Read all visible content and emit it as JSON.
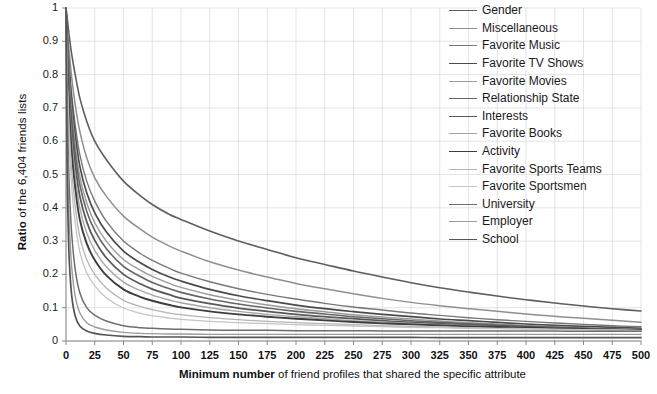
{
  "chart_data": {
    "type": "line",
    "title": "",
    "xlabel_bold": "Minimum number",
    "xlabel_rest": " of friend profiles that shared the specific attribute",
    "ylabel_bold": "Ratio",
    "ylabel_rest": " of the 6,404 friends lists",
    "xlim": [
      0,
      500
    ],
    "ylim": [
      0,
      1
    ],
    "grid": true,
    "legend_position": "top-right",
    "x_ticks": [
      "0",
      "25",
      "50",
      "75",
      "100",
      "125",
      "150",
      "175",
      "200",
      "225",
      "250",
      "275",
      "300",
      "325",
      "350",
      "375",
      "400",
      "425",
      "450",
      "475",
      "500"
    ],
    "y_ticks": [
      "1",
      "0.9",
      "0.8",
      "0.7",
      "0.6",
      "0.5",
      "0.4",
      "0.3",
      "0.2",
      "0.1",
      "0"
    ],
    "x": [
      0,
      1,
      2,
      3,
      5,
      8,
      12,
      18,
      25,
      35,
      50,
      65,
      75,
      90,
      100,
      125,
      150,
      175,
      200,
      225,
      250,
      275,
      300,
      325,
      350,
      375,
      400,
      425,
      450,
      475,
      500
    ],
    "series": [
      {
        "name": "Gender",
        "color": "#5e5e5e",
        "width": 1.6,
        "values": [
          1.0,
          0.97,
          0.94,
          0.91,
          0.86,
          0.8,
          0.73,
          0.66,
          0.6,
          0.545,
          0.48,
          0.435,
          0.41,
          0.38,
          0.365,
          0.33,
          0.3,
          0.275,
          0.25,
          0.23,
          0.21,
          0.192,
          0.175,
          0.16,
          0.147,
          0.135,
          0.124,
          0.114,
          0.105,
          0.097,
          0.09
        ]
      },
      {
        "name": "Miscellaneous",
        "color": "#8f8f8f",
        "width": 1.5,
        "values": [
          1.0,
          0.95,
          0.9,
          0.86,
          0.79,
          0.71,
          0.63,
          0.55,
          0.49,
          0.435,
          0.375,
          0.335,
          0.312,
          0.285,
          0.27,
          0.238,
          0.213,
          0.192,
          0.173,
          0.157,
          0.142,
          0.128,
          0.116,
          0.106,
          0.097,
          0.089,
          0.081,
          0.074,
          0.068,
          0.062,
          0.056
        ]
      },
      {
        "name": "Favorite Music",
        "color": "#787878",
        "width": 1.4,
        "values": [
          1.0,
          0.93,
          0.87,
          0.82,
          0.74,
          0.65,
          0.56,
          0.48,
          0.42,
          0.36,
          0.3,
          0.262,
          0.242,
          0.218,
          0.204,
          0.178,
          0.157,
          0.14,
          0.126,
          0.113,
          0.102,
          0.093,
          0.084,
          0.077,
          0.07,
          0.064,
          0.059,
          0.054,
          0.05,
          0.046,
          0.043
        ]
      },
      {
        "name": "Favorite TV Shows",
        "color": "#4a4a4a",
        "width": 1.7,
        "values": [
          1.0,
          0.92,
          0.855,
          0.8,
          0.715,
          0.62,
          0.525,
          0.445,
          0.385,
          0.328,
          0.27,
          0.234,
          0.215,
          0.192,
          0.18,
          0.155,
          0.136,
          0.121,
          0.108,
          0.097,
          0.088,
          0.08,
          0.073,
          0.066,
          0.061,
          0.056,
          0.051,
          0.047,
          0.044,
          0.041,
          0.038
        ]
      },
      {
        "name": "Favorite Movies",
        "color": "#9a9a9a",
        "width": 1.4,
        "values": [
          1.0,
          0.91,
          0.84,
          0.78,
          0.69,
          0.59,
          0.495,
          0.415,
          0.355,
          0.3,
          0.245,
          0.212,
          0.194,
          0.173,
          0.161,
          0.139,
          0.122,
          0.108,
          0.097,
          0.088,
          0.079,
          0.072,
          0.066,
          0.06,
          0.055,
          0.051,
          0.047,
          0.043,
          0.04,
          0.037,
          0.035
        ]
      },
      {
        "name": "Relationship State",
        "color": "#666666",
        "width": 1.6,
        "values": [
          1.0,
          0.9,
          0.825,
          0.76,
          0.665,
          0.565,
          0.47,
          0.39,
          0.332,
          0.278,
          0.224,
          0.193,
          0.176,
          0.157,
          0.146,
          0.126,
          0.111,
          0.099,
          0.089,
          0.081,
          0.073,
          0.067,
          0.061,
          0.056,
          0.052,
          0.048,
          0.044,
          0.041,
          0.038,
          0.036,
          0.034
        ]
      },
      {
        "name": "Interests",
        "color": "#585858",
        "width": 1.8,
        "values": [
          1.0,
          0.885,
          0.8,
          0.73,
          0.63,
          0.53,
          0.435,
          0.358,
          0.302,
          0.25,
          0.2,
          0.171,
          0.156,
          0.139,
          0.129,
          0.112,
          0.099,
          0.089,
          0.08,
          0.073,
          0.067,
          0.061,
          0.056,
          0.052,
          0.048,
          0.045,
          0.042,
          0.039,
          0.037,
          0.035,
          0.033
        ]
      },
      {
        "name": "Favorite Books",
        "color": "#a5a5a5",
        "width": 1.4,
        "values": [
          1.0,
          0.87,
          0.78,
          0.705,
          0.6,
          0.495,
          0.4,
          0.325,
          0.272,
          0.223,
          0.177,
          0.151,
          0.138,
          0.123,
          0.115,
          0.1,
          0.089,
          0.08,
          0.073,
          0.067,
          0.061,
          0.057,
          0.053,
          0.049,
          0.046,
          0.043,
          0.04,
          0.038,
          0.036,
          0.034,
          0.032
        ]
      },
      {
        "name": "Activity",
        "color": "#3d3d3d",
        "width": 1.9,
        "values": [
          1.0,
          0.85,
          0.755,
          0.675,
          0.565,
          0.46,
          0.365,
          0.293,
          0.243,
          0.197,
          0.155,
          0.132,
          0.121,
          0.108,
          0.101,
          0.089,
          0.08,
          0.073,
          0.067,
          0.062,
          0.057,
          0.053,
          0.05,
          0.047,
          0.044,
          0.042,
          0.04,
          0.038,
          0.036,
          0.034,
          0.032
        ]
      },
      {
        "name": "Favorite Sports Teams",
        "color": "#b4b4b4",
        "width": 1.3,
        "values": [
          1.0,
          0.82,
          0.71,
          0.625,
          0.51,
          0.405,
          0.313,
          0.245,
          0.2,
          0.159,
          0.122,
          0.103,
          0.094,
          0.084,
          0.079,
          0.07,
          0.064,
          0.059,
          0.055,
          0.052,
          0.049,
          0.046,
          0.044,
          0.042,
          0.04,
          0.038,
          0.037,
          0.035,
          0.034,
          0.033,
          0.031
        ]
      },
      {
        "name": "Favorite Sportsmen",
        "color": "#c4c4c4",
        "width": 1.3,
        "values": [
          1.0,
          0.79,
          0.67,
          0.58,
          0.46,
          0.355,
          0.268,
          0.205,
          0.166,
          0.13,
          0.099,
          0.083,
          0.076,
          0.069,
          0.065,
          0.059,
          0.055,
          0.052,
          0.049,
          0.047,
          0.045,
          0.043,
          0.041,
          0.04,
          0.038,
          0.037,
          0.036,
          0.035,
          0.034,
          0.033,
          0.031
        ]
      },
      {
        "name": "University",
        "color": "#6e6e6e",
        "width": 1.5,
        "values": [
          1.0,
          0.72,
          0.56,
          0.45,
          0.32,
          0.215,
          0.145,
          0.1,
          0.078,
          0.06,
          0.046,
          0.04,
          0.038,
          0.036,
          0.035,
          0.033,
          0.032,
          0.032,
          0.031,
          0.031,
          0.031,
          0.03,
          0.03,
          0.03,
          0.03,
          0.03,
          0.03,
          0.03,
          0.029,
          0.029,
          0.029
        ]
      },
      {
        "name": "Employer",
        "color": "#9c9c9c",
        "width": 1.4,
        "values": [
          1.0,
          0.63,
          0.45,
          0.34,
          0.22,
          0.135,
          0.085,
          0.055,
          0.042,
          0.033,
          0.026,
          0.023,
          0.022,
          0.021,
          0.021,
          0.02,
          0.02,
          0.02,
          0.02,
          0.02,
          0.02,
          0.02,
          0.02,
          0.02,
          0.02,
          0.02,
          0.02,
          0.02,
          0.02,
          0.02,
          0.02
        ]
      },
      {
        "name": "School",
        "color": "#555555",
        "width": 1.7,
        "values": [
          1.0,
          0.52,
          0.33,
          0.23,
          0.135,
          0.075,
          0.045,
          0.03,
          0.023,
          0.018,
          0.014,
          0.013,
          0.012,
          0.012,
          0.012,
          0.011,
          0.011,
          0.011,
          0.011,
          0.011,
          0.011,
          0.011,
          0.011,
          0.01,
          0.01,
          0.01,
          0.01,
          0.01,
          0.01,
          0.01,
          0.01
        ]
      }
    ]
  }
}
